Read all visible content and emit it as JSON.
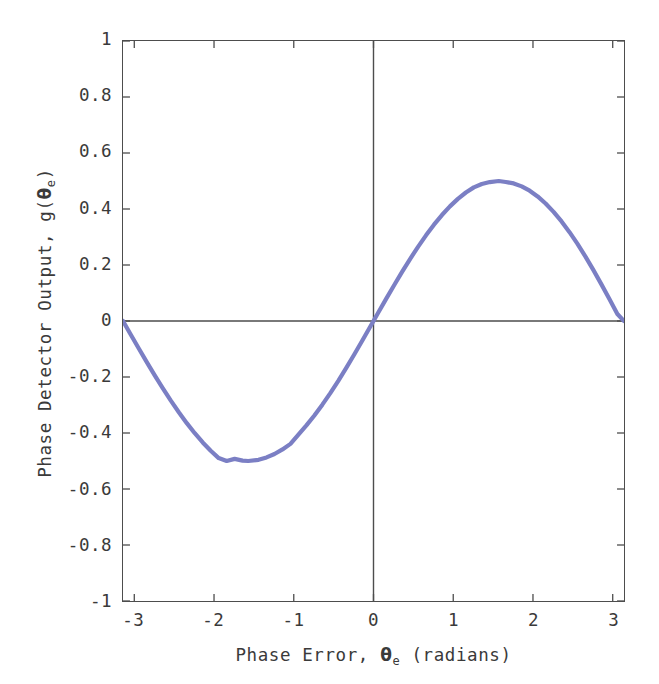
{
  "chart_data": {
    "type": "line",
    "title": "",
    "subtitle": "",
    "xlabel_plain": "Phase Error, θe (radians)",
    "xlabel_prefix": "Phase Error, ",
    "xlabel_symbol": "θ",
    "xlabel_subscript": "e",
    "xlabel_suffix": " (radians)",
    "ylabel_plain": "Phase Detector Output, g(θe)",
    "ylabel_prefix": "Phase Detector Output, g(",
    "ylabel_symbol": "θ",
    "ylabel_subscript": "e",
    "ylabel_suffix": ")",
    "xlim": [
      -3.14159265,
      3.14159265
    ],
    "ylim": [
      -1,
      1
    ],
    "xticks": [
      -3,
      -2,
      -1,
      0,
      1,
      2,
      3
    ],
    "xtick_labels": [
      "-3",
      "-2",
      "-1",
      "0",
      "1",
      "2",
      "3"
    ],
    "yticks": [
      1,
      0.8,
      0.6,
      0.4,
      0.2,
      0,
      -0.2,
      -0.4,
      -0.6,
      -0.8,
      -1
    ],
    "ytick_labels": [
      "1",
      "0.8",
      "0.6",
      "0.4",
      "0.2",
      "0",
      "-0.2",
      "-0.4",
      "-0.6",
      "-0.8",
      "-1"
    ],
    "grid": false,
    "legend": null,
    "zero_lines": {
      "horizontal_y": 0,
      "vertical_x": 0
    },
    "line_color": "#7b7fc4",
    "line_width": 4.2,
    "axis_color": "#4d4d4d",
    "background": "#ffffff",
    "equation": "g(θe) = 0.5*sin(θe)",
    "series": [
      {
        "name": "g(θe)",
        "amplitude": 0.5,
        "x": [
          -3.14159265,
          -3.04159265,
          -2.94159265,
          -2.84159265,
          -2.74159265,
          -2.64159265,
          -2.54159265,
          -2.44159265,
          -2.34159265,
          -2.24159265,
          -2.14159265,
          -2.04159265,
          -1.94159265,
          -1.84159265,
          -1.74159265,
          -1.64159265,
          -1.57079633,
          -1.44159265,
          -1.34159265,
          -1.24159265,
          -1.14159265,
          -1.04159265,
          -0.94159265,
          -0.84159265,
          -0.74159265,
          -0.64159265,
          -0.54159265,
          -0.44159265,
          -0.34159265,
          -0.24159265,
          -0.14159265,
          -0.04159265,
          0,
          0.05840735,
          0.15840735,
          0.25840735,
          0.35840735,
          0.45840735,
          0.55840735,
          0.65840735,
          0.75840735,
          0.85840735,
          0.95840735,
          1.05840735,
          1.15840735,
          1.25840735,
          1.35840735,
          1.45840735,
          1.57079633,
          1.65840735,
          1.75840735,
          1.85840735,
          1.95840735,
          2.05840735,
          2.15840735,
          2.25840735,
          2.35840735,
          2.45840735,
          2.55840735,
          2.65840735,
          2.75840735,
          2.85840735,
          2.95840735,
          3.05840735,
          3.14159265
        ],
        "y": [
          0,
          -0.0499,
          -0.0993,
          -0.1478,
          -0.1951,
          -0.2408,
          -0.2845,
          -0.3259,
          -0.3648,
          -0.4008,
          -0.4338,
          -0.4634,
          -0.4896,
          -0.5,
          -0.4924,
          -0.4987,
          -0.5,
          -0.4958,
          -0.4872,
          -0.4749,
          -0.4587,
          -0.4389,
          -0.4055,
          -0.3729,
          -0.3376,
          -0.2988,
          -0.2576,
          -0.2137,
          -0.1675,
          -0.1196,
          -0.0706,
          -0.0208,
          0,
          0.0292,
          0.0789,
          0.1277,
          0.1752,
          0.2213,
          0.2649,
          0.3059,
          0.3439,
          0.3784,
          0.4093,
          0.4362,
          0.4589,
          0.4772,
          0.4893,
          0.4962,
          0.5,
          0.4966,
          0.4913,
          0.4808,
          0.4653,
          0.4449,
          0.4197,
          0.3898,
          0.3556,
          0.3173,
          0.2752,
          0.2298,
          0.1815,
          0.1309,
          0.0785,
          0.0249,
          0
        ]
      }
    ]
  }
}
